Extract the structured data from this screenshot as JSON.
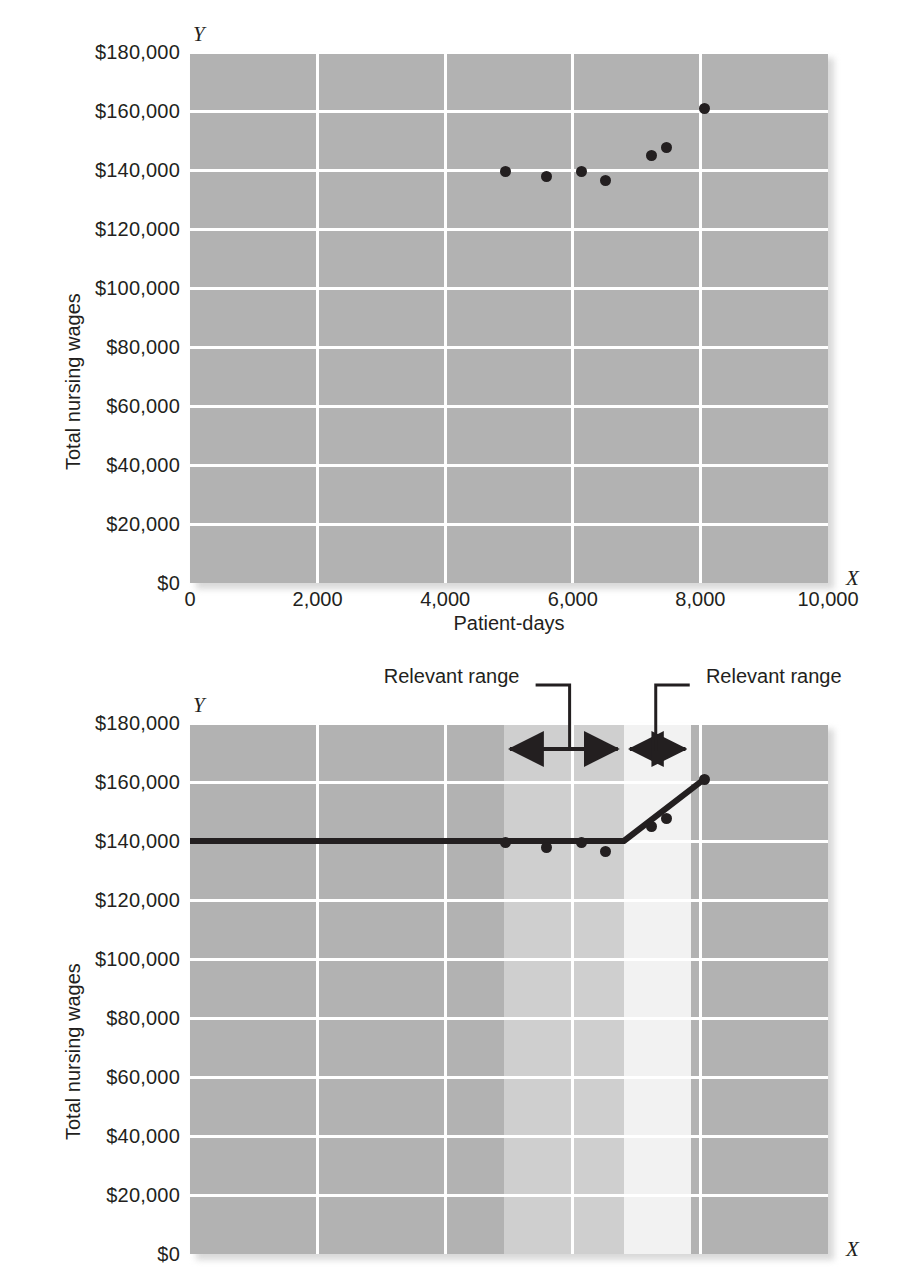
{
  "figure": {
    "background": "#ffffff",
    "plot_background": "#b2b2b2",
    "grid_color": "#ffffff",
    "marker_color": "#231f20",
    "line_color": "#231f20",
    "band_mid_color": "#cfcfcf",
    "band_light_color": "#f2f2f2"
  },
  "chart_data": [
    {
      "id": "scatter-only",
      "type": "scatter",
      "title": "",
      "xlabel": "Patient-days",
      "ylabel": "Total nursing wages",
      "x_axis_letter": "X",
      "y_axis_letter": "Y",
      "xlim": [
        0,
        10000
      ],
      "ylim": [
        0,
        180000
      ],
      "xticks": [
        0,
        2000,
        4000,
        6000,
        8000,
        10000
      ],
      "xticklabels": [
        "0",
        "2,000",
        "4,000",
        "6,000",
        "8,000",
        "10,000"
      ],
      "yticks": [
        0,
        20000,
        40000,
        60000,
        80000,
        100000,
        120000,
        140000,
        160000,
        180000
      ],
      "yticklabels": [
        "$0",
        "$20,000",
        "$40,000",
        "$60,000",
        "$80,000",
        "$100,000",
        "$120,000",
        "$140,000",
        "$160,000",
        "$180,000"
      ],
      "grid": true,
      "legend": "none",
      "series": [
        {
          "name": "Observed nursing wages",
          "points": [
            {
              "x": 4940,
              "y": 139500
            },
            {
              "x": 5580,
              "y": 137800
            },
            {
              "x": 6140,
              "y": 139500
            },
            {
              "x": 6520,
              "y": 136500
            },
            {
              "x": 7230,
              "y": 145000
            },
            {
              "x": 7470,
              "y": 147500
            },
            {
              "x": 8060,
              "y": 161000
            }
          ]
        }
      ]
    },
    {
      "id": "scatter-with-step-cost-line",
      "type": "scatter",
      "title": "",
      "xlabel": "Patient-days",
      "ylabel": "Total nursing wages",
      "x_axis_letter": "X",
      "y_axis_letter": "Y",
      "xlim": [
        0,
        10000
      ],
      "ylim": [
        0,
        180000
      ],
      "xticks": [
        0,
        2000,
        4000,
        6000,
        8000,
        10000
      ],
      "xticklabels": [
        "0",
        "2,000",
        "4,000",
        "6,000",
        "8,000",
        "10,000"
      ],
      "yticks": [
        0,
        20000,
        40000,
        60000,
        80000,
        100000,
        120000,
        140000,
        160000,
        180000
      ],
      "yticklabels": [
        "$0",
        "$20,000",
        "$40,000",
        "$60,000",
        "$80,000",
        "$100,000",
        "$120,000",
        "$140,000",
        "$160,000",
        "$180,000"
      ],
      "grid": true,
      "legend": "none",
      "series": [
        {
          "name": "Observed nursing wages",
          "points": [
            {
              "x": 4940,
              "y": 139500
            },
            {
              "x": 5580,
              "y": 137800
            },
            {
              "x": 6140,
              "y": 139500
            },
            {
              "x": 6520,
              "y": 136500
            },
            {
              "x": 7230,
              "y": 145000
            },
            {
              "x": 7470,
              "y": 147500
            },
            {
              "x": 8060,
              "y": 161000
            }
          ]
        },
        {
          "name": "Fitted cost line",
          "type": "line",
          "points": [
            {
              "x": 0,
              "y": 140000
            },
            {
              "x": 6800,
              "y": 140000
            },
            {
              "x": 8060,
              "y": 161000
            }
          ]
        }
      ],
      "shaded_bands": [
        {
          "name": "relevant-range-1",
          "x_from": 4920,
          "x_to": 6800,
          "color": "#cfcfcf"
        },
        {
          "name": "relevant-range-2",
          "x_from": 6800,
          "x_to": 7860,
          "color": "#f2f2f2"
        }
      ],
      "annotations": [
        {
          "name": "relevant-range-left",
          "text": "Relevant range",
          "x_from": 4920,
          "x_to": 6800,
          "leader_x": 5950
        },
        {
          "name": "relevant-range-right",
          "text": "Relevant range",
          "x_from": 6800,
          "x_to": 7860,
          "leader_x": 7300
        }
      ]
    }
  ]
}
